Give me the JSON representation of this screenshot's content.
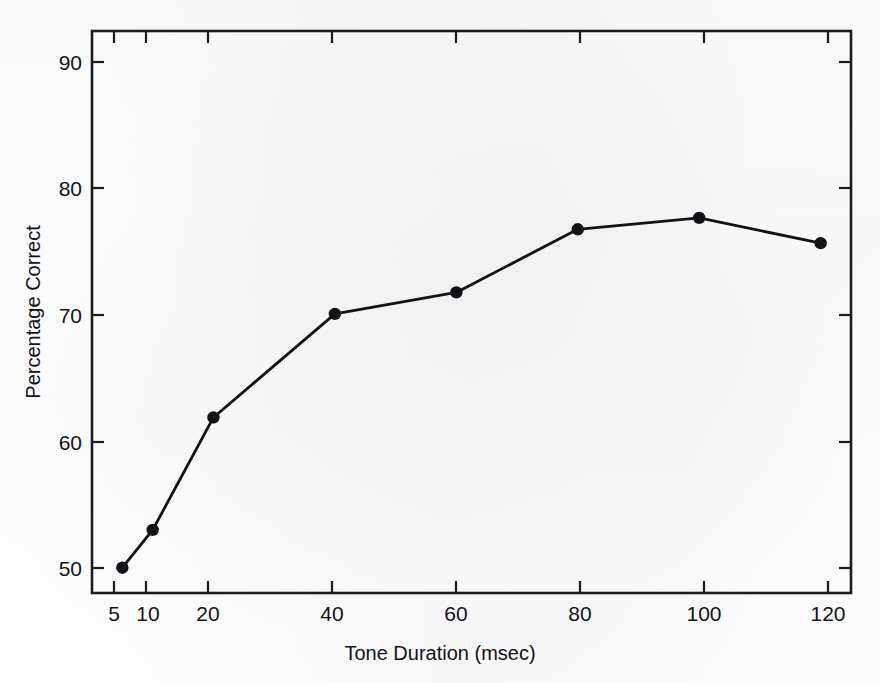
{
  "chart_data": {
    "type": "line",
    "title": "",
    "xlabel": "Tone Duration (msec)",
    "ylabel": "Percentage Correct",
    "x": [
      5,
      10,
      20,
      40,
      60,
      80,
      100,
      120
    ],
    "values": [
      50.0,
      53.0,
      61.9,
      70.1,
      71.8,
      76.8,
      77.7,
      75.7
    ],
    "series": [
      {
        "name": "Percentage Correct",
        "values": [
          50.0,
          53.0,
          61.9,
          70.1,
          71.8,
          76.8,
          77.7,
          75.7
        ]
      }
    ],
    "xtick_labels": [
      "5",
      "10",
      "20",
      "40",
      "60",
      "80",
      "100",
      "120"
    ],
    "xtick_values": [
      5,
      10,
      20,
      40,
      60,
      80,
      100,
      120
    ],
    "ytick_labels": [
      "50",
      "60",
      "70",
      "80",
      "90"
    ],
    "ytick_values": [
      50,
      60,
      70,
      80,
      90
    ],
    "xlim": [
      0,
      125
    ],
    "ylim": [
      48.0,
      92.5
    ],
    "grid": false,
    "legend": "none",
    "marker": "filled-circle",
    "line_color": "#111215",
    "marker_color": "#111215",
    "axis_color": "#1a1b1e",
    "background_color": "#fefefe",
    "frame": "full-box",
    "tick_direction": "in"
  },
  "axes": {
    "x_title": "Tone Duration (msec)",
    "y_title": "Percentage Correct"
  },
  "ticks": {
    "x": [
      {
        "label": "5",
        "value": 5
      },
      {
        "label": "10",
        "value": 10
      },
      {
        "label": "20",
        "value": 20
      },
      {
        "label": "40",
        "value": 40
      },
      {
        "label": "60",
        "value": 60
      },
      {
        "label": "80",
        "value": 80
      },
      {
        "label": "100",
        "value": 100
      },
      {
        "label": "120",
        "value": 120
      }
    ],
    "y": [
      {
        "label": "90",
        "value": 90
      },
      {
        "label": "80",
        "value": 80
      },
      {
        "label": "70",
        "value": 70
      },
      {
        "label": "60",
        "value": 60
      },
      {
        "label": "50",
        "value": 50
      }
    ]
  }
}
